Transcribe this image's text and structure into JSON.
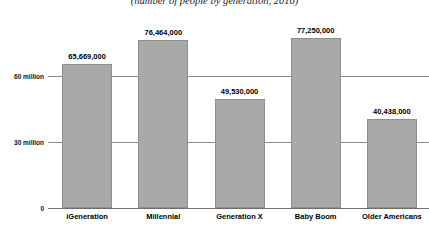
{
  "chart_data": {
    "type": "bar",
    "title": "",
    "subtitle": "(number of people by generation, 2016)",
    "xlabel": "",
    "ylabel": "",
    "categories": [
      "iGeneration",
      "Millennial",
      "Generation X",
      "Baby Boom",
      "Older Americans"
    ],
    "values": [
      65669000,
      76464000,
      49530000,
      77250000,
      40438000
    ],
    "value_labels": [
      "65,669,000",
      "76,464,000",
      "49,530,000",
      "77,250,000",
      "40,438,000"
    ],
    "ylim": [
      0,
      90000000
    ],
    "yticks": [
      0,
      30000000,
      60000000
    ],
    "ytick_labels": [
      "0",
      "30 million",
      "60 million"
    ],
    "grid": true,
    "legend": "none",
    "bar_color": "#a9a9a9",
    "bar_border_color": "#8f8f8f",
    "gridline_color": "#8a8a8a",
    "axis_color": "#6e6e6e",
    "text_color": "#000000",
    "background": "#ffffff"
  }
}
